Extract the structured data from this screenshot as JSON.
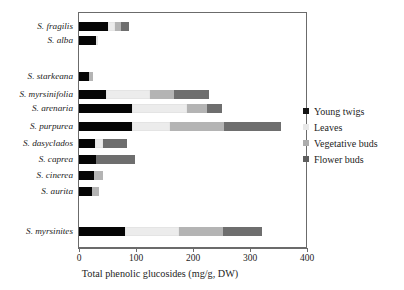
{
  "chart_data": {
    "type": "bar",
    "orientation": "horizontal",
    "stacked": true,
    "title": "",
    "xlabel": "Total phenolic glucosides  (mg/g, DW)",
    "ylabel": "",
    "xlim": [
      0,
      400
    ],
    "xticks": [
      0,
      100,
      200,
      300,
      400
    ],
    "xtick_labels": [
      "0",
      "100",
      "200",
      "300",
      "400"
    ],
    "grid": false,
    "legend_position": "right",
    "categories": [
      "S. fragilis",
      "S. alba",
      "",
      "S. starkeana",
      "S. myrsinifolia",
      "S. arenaria",
      "S. purpurea",
      "S. dasyclados",
      "S. caprea",
      "S. cinerea",
      "S. aurita",
      "",
      "S. myrsinites"
    ],
    "series": [
      {
        "name": "Young twigs",
        "color": "#050505",
        "values": [
          50,
          30,
          null,
          17,
          48,
          93,
          93,
          28,
          30,
          27,
          23,
          null,
          80
        ]
      },
      {
        "name": "Leaves",
        "color": "#ececec",
        "values": [
          13,
          3,
          null,
          0,
          77,
          97,
          66,
          14,
          0,
          0,
          0,
          null,
          95
        ]
      },
      {
        "name": "Vegetative buds",
        "color": "#b4b4b4",
        "values": [
          10,
          0,
          null,
          7,
          42,
          35,
          96,
          0,
          0,
          15,
          12,
          null,
          78
        ]
      },
      {
        "name": "Flower buds",
        "color": "#6e6e6e",
        "values": [
          14,
          0,
          null,
          0,
          61,
          26,
          99,
          42,
          68,
          0,
          0,
          null,
          68
        ]
      }
    ],
    "totals": [
      87,
      33,
      null,
      24,
      228,
      251,
      354,
      84,
      98,
      42,
      35,
      null,
      321
    ]
  },
  "legend": {
    "items": [
      {
        "label": "Young twigs",
        "color": "#151515"
      },
      {
        "label": "Leaves",
        "color": "#e8e8e8"
      },
      {
        "label": "Vegetative buds",
        "color": "#adadad"
      },
      {
        "label": "Flower buds",
        "color": "#5e5e5e"
      }
    ]
  }
}
